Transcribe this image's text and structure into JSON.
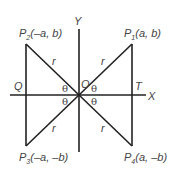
{
  "diagram": {
    "axes": {
      "x_label": "X",
      "y_label": "Y",
      "origin_label": "O"
    },
    "points": [
      {
        "id": "P1",
        "name": "P",
        "sub": "1",
        "coords": "(a, b)"
      },
      {
        "id": "P2",
        "name": "P",
        "sub": "2",
        "coords": "(–a, b)"
      },
      {
        "id": "P3",
        "name": "P",
        "sub": "3",
        "coords": "(–a, –b)"
      },
      {
        "id": "P4",
        "name": "P",
        "sub": "4",
        "coords": "(a, –b)"
      }
    ],
    "foot_labels": {
      "left": "Q",
      "right": "T"
    },
    "radius_label": "r",
    "angle_label": "θ"
  }
}
